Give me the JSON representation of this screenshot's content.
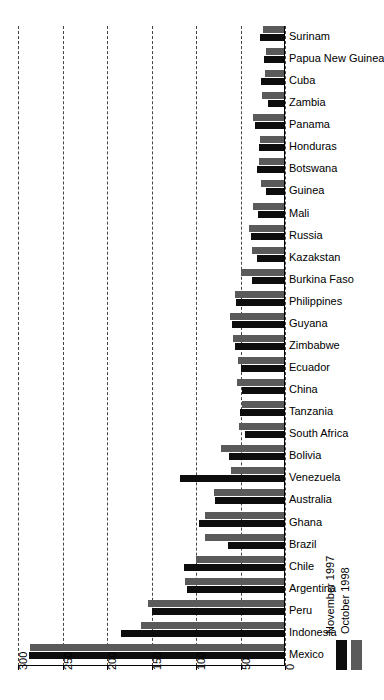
{
  "chart_data": {
    "type": "bar",
    "orientation": "horizontal",
    "title": "",
    "subtitle": "",
    "xlabel": "",
    "ylabel": "",
    "xlim": [
      300,
      0
    ],
    "x_reversed": true,
    "xticks": [
      300,
      250,
      200,
      150,
      100,
      50,
      0
    ],
    "xticklabels": [
      "300",
      "250",
      "200",
      "150",
      "100",
      "50",
      "0"
    ],
    "grid": true,
    "grid_style": "dashed",
    "legend_position": "right",
    "legend": [
      "November 1997",
      "October 1998"
    ],
    "series": [
      {
        "name": "November 1997",
        "color": "#0d0d0d",
        "values": [
          28,
          24,
          27,
          19,
          34,
          29,
          31,
          21,
          30,
          38,
          31,
          37,
          55,
          60,
          56,
          49,
          48,
          51,
          45,
          63,
          118,
          79,
          97,
          64,
          113,
          110,
          150,
          184,
          288
        ]
      },
      {
        "name": "October 1998",
        "color": "#5a5a5a",
        "values": [
          25,
          21,
          22,
          26,
          36,
          28,
          29,
          27,
          36,
          41,
          37,
          50,
          56,
          62,
          58,
          53,
          54,
          48,
          52,
          72,
          61,
          80,
          90,
          90,
          100,
          112,
          154,
          162,
          286
        ]
      }
    ],
    "categories": [
      "Surinam",
      "Papua New Guinea",
      "Cuba",
      "Zambia",
      "Panama",
      "Honduras",
      "Botswana",
      "Guinea",
      "Mali",
      "Russia",
      "Kazakstan",
      "Burkina Faso",
      "Philippines",
      "Guyana",
      "Zimbabwe",
      "Ecuador",
      "China",
      "Tanzania",
      "South Africa",
      "Bolivia",
      "Venezuela",
      "Australia",
      "Ghana",
      "Brazil",
      "Chile",
      "Argentina",
      "Peru",
      "Indonesia",
      "Mexico"
    ]
  }
}
